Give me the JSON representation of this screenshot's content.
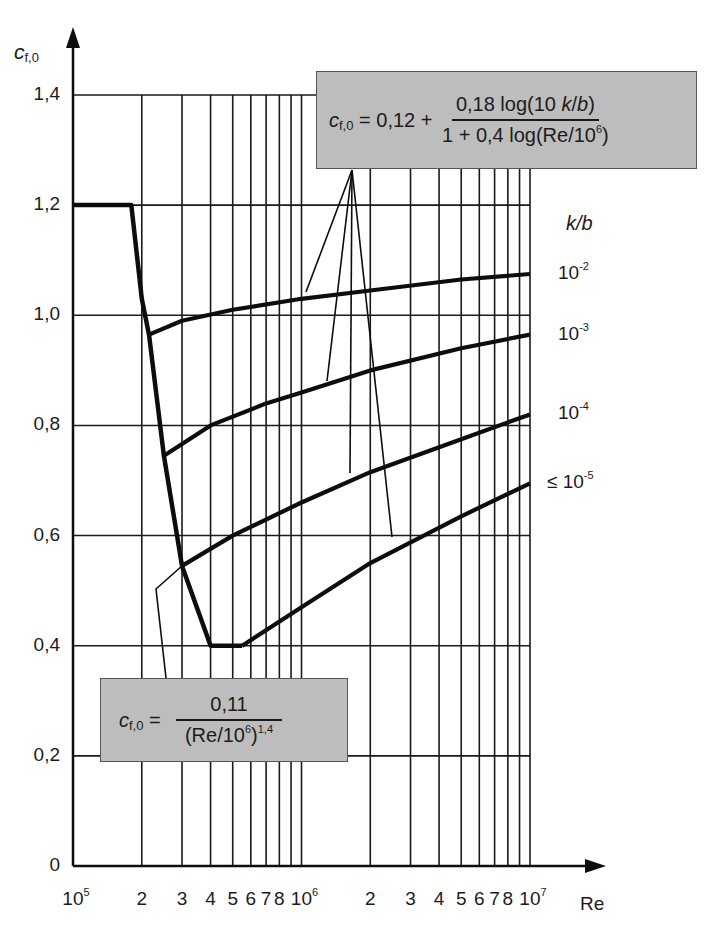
{
  "chart_data": {
    "type": "line",
    "title": "",
    "xlabel": "Re",
    "ylabel": "c_f,0",
    "xscale": "log",
    "xlim": [
      100000,
      10000000
    ],
    "ylim": [
      0,
      1.4
    ],
    "grid": true,
    "legend_title": "k/b",
    "x_tick_labels": [
      "10^5",
      "2",
      "3",
      "4",
      "5",
      "6",
      "7",
      "8",
      "10^6",
      "2",
      "3",
      "4",
      "5",
      "6",
      "7",
      "8",
      "10^7"
    ],
    "y_tick_labels": [
      "0",
      "0,2",
      "0,4",
      "0,6",
      "0,8",
      "1,0",
      "1,2",
      "1,4"
    ],
    "series": [
      {
        "name": "envelope (smooth surface / transition)",
        "points": [
          [
            100000,
            1.2
          ],
          [
            180000,
            1.2
          ],
          [
            200000,
            1.03
          ],
          [
            215000,
            0.965
          ],
          [
            250000,
            0.745
          ],
          [
            300000,
            0.545
          ],
          [
            400000,
            0.4
          ],
          [
            550000,
            0.4
          ]
        ]
      },
      {
        "name": "10^-2",
        "points": [
          [
            215000,
            0.965
          ],
          [
            300000,
            0.99
          ],
          [
            500000,
            1.01
          ],
          [
            1000000,
            1.03
          ],
          [
            2000000,
            1.045
          ],
          [
            5000000,
            1.065
          ],
          [
            10000000,
            1.075
          ]
        ]
      },
      {
        "name": "10^-3",
        "points": [
          [
            250000,
            0.745
          ],
          [
            400000,
            0.8
          ],
          [
            700000,
            0.84
          ],
          [
            1000000,
            0.86
          ],
          [
            2000000,
            0.9
          ],
          [
            5000000,
            0.94
          ],
          [
            10000000,
            0.965
          ]
        ]
      },
      {
        "name": "10^-4",
        "points": [
          [
            300000,
            0.545
          ],
          [
            500000,
            0.6
          ],
          [
            1000000,
            0.66
          ],
          [
            2000000,
            0.715
          ],
          [
            5000000,
            0.775
          ],
          [
            10000000,
            0.82
          ]
        ]
      },
      {
        "name": "≤ 10^-5",
        "points": [
          [
            550000,
            0.4
          ],
          [
            1000000,
            0.47
          ],
          [
            2000000,
            0.55
          ],
          [
            5000000,
            0.635
          ],
          [
            10000000,
            0.695
          ]
        ]
      }
    ],
    "annotations": [
      "c_f,0 = 0,12 + 0,18 log(10 k/b) / (1 + 0,4 log(Re/10^6))",
      "c_f,0 = 0,11 / (Re/10^6)^1,4"
    ]
  },
  "axes": {
    "y_title_main": "c",
    "y_title_sub": "f,0",
    "x_title": "Re",
    "y_ticks": [
      {
        "label": "0",
        "value": 0
      },
      {
        "label": "0,2",
        "value": 0.2
      },
      {
        "label": "0,4",
        "value": 0.4
      },
      {
        "label": "0,6",
        "value": 0.6
      },
      {
        "label": "0,8",
        "value": 0.8
      },
      {
        "label": "1,0",
        "value": 1.0
      },
      {
        "label": "1,2",
        "value": 1.2
      },
      {
        "label": "1,4",
        "value": 1.4
      }
    ],
    "x_ticks": [
      {
        "label": "10",
        "sup": "5",
        "value": 100000
      },
      {
        "label": "2",
        "value": 200000
      },
      {
        "label": "3",
        "value": 300000
      },
      {
        "label": "4",
        "value": 400000
      },
      {
        "label": "5",
        "value": 500000
      },
      {
        "label": "6",
        "value": 600000
      },
      {
        "label": "7",
        "value": 700000
      },
      {
        "label": "8",
        "value": 800000
      },
      {
        "label": "10",
        "sup": "6",
        "value": 1000000
      },
      {
        "label": "2",
        "value": 2000000
      },
      {
        "label": "3",
        "value": 3000000
      },
      {
        "label": "4",
        "value": 4000000
      },
      {
        "label": "5",
        "value": 5000000
      },
      {
        "label": "6",
        "value": 6000000
      },
      {
        "label": "7",
        "value": 7000000
      },
      {
        "label": "8",
        "value": 8000000
      },
      {
        "label": "10",
        "sup": "7",
        "value": 10000000
      }
    ],
    "x_grid_values": [
      200000,
      300000,
      400000,
      500000,
      600000,
      700000,
      800000,
      900000,
      1000000,
      2000000,
      3000000,
      4000000,
      5000000,
      6000000,
      7000000,
      8000000,
      9000000,
      10000000
    ]
  },
  "legend": {
    "title": "k/b",
    "items": [
      {
        "base": "10",
        "exp": "-2",
        "prefix": ""
      },
      {
        "base": "10",
        "exp": "-3",
        "prefix": ""
      },
      {
        "base": "10",
        "exp": "-4",
        "prefix": ""
      },
      {
        "base": "10",
        "exp": "-5",
        "prefix": "≤ "
      }
    ]
  },
  "formula_top": {
    "lhs_main": "c",
    "lhs_sub": "f,0",
    "eq": " = 0,12 + ",
    "num_a": "0,18 log(10 ",
    "num_k": "k",
    "num_slash": "/",
    "num_b": "b",
    "num_close": ")",
    "den_a": "1 + 0,4 log(Re/10",
    "den_sup": "6",
    "den_close": ")"
  },
  "formula_bottom": {
    "lhs_main": "c",
    "lhs_sub": "f,0",
    "eq": " = ",
    "num": "0,11",
    "den_a": "(Re/10",
    "den_sup": "6",
    "den_close": ")",
    "den_exp": "1,4"
  },
  "colors": {
    "line": "#0d0d0d",
    "grid": "#1a1a1a",
    "box_fill": "#bdbdbd",
    "box_border": "#555555"
  }
}
